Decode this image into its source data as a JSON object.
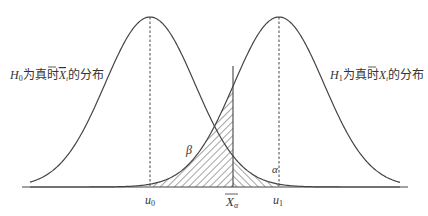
{
  "diagram": {
    "left_label": {
      "prefix": "H",
      "sub": "0",
      "text_before": "为真时",
      "xbar": "X",
      "xbar_sub": "i",
      "text_after": "的分布"
    },
    "right_label": {
      "prefix": "H",
      "sub": "1",
      "text_before": "为真时",
      "xbar": "X",
      "xbar_sub": "i",
      "text_after": "的分布"
    },
    "axis_labels": {
      "u0": {
        "base": "u",
        "sub": "0"
      },
      "xa": {
        "base": "X",
        "sub": "α"
      },
      "u1": {
        "base": "u",
        "sub": "1"
      }
    },
    "region_labels": {
      "beta": "β",
      "alpha": "α"
    },
    "colors": {
      "line": "#444444",
      "hatch": "#333333",
      "background": "#ffffff"
    },
    "geometry": {
      "baseline_y": 187,
      "peak_y": 17,
      "mu0_x": 150,
      "mu1_x": 279,
      "sigma": 45,
      "critical_x": 233,
      "critical_top_y": 66,
      "axis_x0": 22,
      "axis_x1": 408
    }
  }
}
